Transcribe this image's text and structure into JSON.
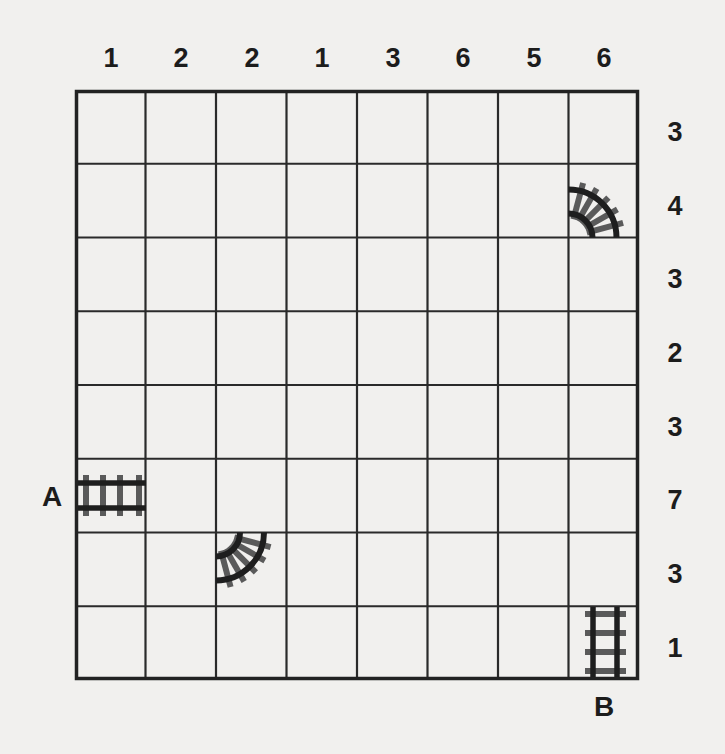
{
  "puzzle": {
    "type": "train-tracks",
    "grid": {
      "columns": 8,
      "rows": 8
    },
    "column_clues": [
      "1",
      "2",
      "2",
      "1",
      "3",
      "6",
      "5",
      "6"
    ],
    "row_clues": [
      "3",
      "4",
      "3",
      "2",
      "3",
      "7",
      "3",
      "1"
    ],
    "endpoints": {
      "start": {
        "label": "A",
        "row": 5,
        "col": 0,
        "edge": "left"
      },
      "end": {
        "label": "B",
        "row": 7,
        "col": 7,
        "edge": "bottom"
      }
    },
    "given_tracks": [
      {
        "row": 1,
        "col": 7,
        "shape": "curve",
        "connects": [
          "left",
          "bottom"
        ]
      },
      {
        "row": 5,
        "col": 0,
        "shape": "straight",
        "connects": [
          "left",
          "right"
        ]
      },
      {
        "row": 6,
        "col": 2,
        "shape": "curve",
        "connects": [
          "left",
          "top"
        ]
      },
      {
        "row": 7,
        "col": 7,
        "shape": "straight",
        "connects": [
          "top",
          "bottom"
        ]
      }
    ]
  },
  "colors": {
    "background": "#f1f0ee",
    "grid_line": "#2a2a2a",
    "rail": "#1e1e1e",
    "tie": "#5a5a5a",
    "text": "#1c1c1c"
  }
}
